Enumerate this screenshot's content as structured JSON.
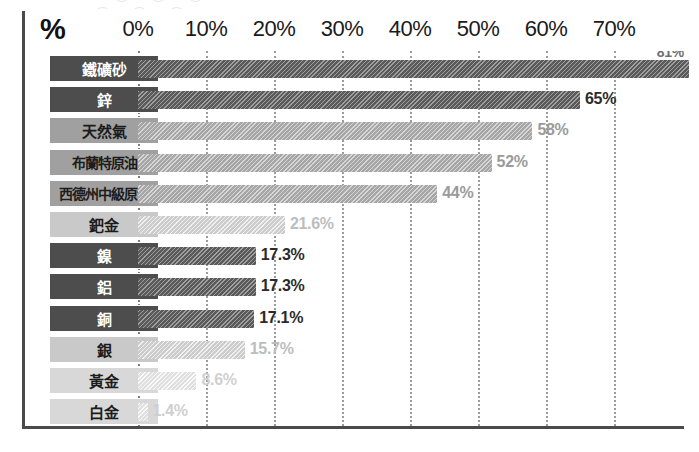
{
  "title_remnant": "︵ ︶ ︵ ︶ ︵ ︶",
  "axis": {
    "unit_symbol": "%",
    "tick_labels": [
      "0%",
      "10%",
      "20%",
      "30%",
      "40%",
      "50%",
      "60%",
      "70%"
    ],
    "tick_values": [
      0,
      10,
      20,
      30,
      40,
      50,
      60,
      70
    ]
  },
  "colors": {
    "bar_dark": "#5a5a5a",
    "bar_mid": "#a6a6a6",
    "bar_light": "#cccccc",
    "bar_pale": "#e0e0e0",
    "label_dark": "#4d4d4d",
    "label_mid": "#a0a0a0",
    "label_light": "#c9c9c9",
    "label_pale": "#d8d8d8",
    "axis_line": "#4a4a4a",
    "gridline": "#9b9b9b",
    "text_dark": "#111111"
  },
  "chart_data": {
    "type": "bar",
    "orientation": "horizontal",
    "title": "",
    "xlabel": "%",
    "ylabel": "",
    "xlim": [
      0,
      75
    ],
    "grid": true,
    "legend": "none",
    "categories": [
      "鐵礦砂",
      "鋅",
      "天然氣",
      "布蘭特原油",
      "西德州中級原油",
      "鈀金",
      "鎳",
      "鋁",
      "銅",
      "銀",
      "黃金",
      "白金"
    ],
    "values": [
      81,
      65,
      58,
      52,
      44,
      21.6,
      17.3,
      17.3,
      17.1,
      15.7,
      8.6,
      1.4
    ],
    "value_labels": [
      "81%",
      "65%",
      "58%",
      "52%",
      "44%",
      "21.6%",
      "17.3%",
      "17.3%",
      "17.1%",
      "15.7%",
      "8.6%",
      "1.4%"
    ],
    "shades": [
      "dark",
      "dark",
      "mid",
      "mid",
      "mid",
      "light",
      "dark",
      "dark",
      "dark",
      "light",
      "pale",
      "pale"
    ]
  }
}
